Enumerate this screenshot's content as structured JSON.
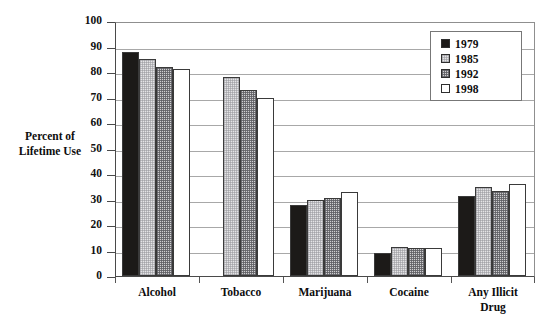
{
  "chart_data": {
    "type": "bar",
    "title": "",
    "xlabel": "",
    "ylabel": "Percent of Lifetime Use",
    "ylim": [
      0,
      100
    ],
    "ytick_step": 10,
    "yticks": [
      0,
      10,
      20,
      30,
      40,
      50,
      60,
      70,
      80,
      90,
      100
    ],
    "grid": true,
    "legend_position": "top-right",
    "categories": [
      "Alcohol",
      "Tobacco",
      "Marijuana",
      "Cocaine",
      "Any Illicit Drug"
    ],
    "series": [
      {
        "name": "1979",
        "color": "#1c1a18",
        "values": [
          88,
          null,
          28,
          9,
          31.5
        ]
      },
      {
        "name": "1985",
        "color": "#e4e4e6",
        "values": [
          85,
          78,
          30,
          11.5,
          35
        ]
      },
      {
        "name": "1992",
        "color": "#cfcfd1",
        "values": [
          82,
          73,
          30.5,
          11,
          33.5
        ]
      },
      {
        "name": "1998",
        "color": "#ffffff",
        "values": [
          81,
          70,
          33,
          11,
          36
        ]
      }
    ]
  },
  "axis": {
    "y_title_line1": "Percent of",
    "y_title_line2": "Lifetime Use"
  },
  "category_labels": [
    {
      "line1": "Alcohol",
      "line2": ""
    },
    {
      "line1": "Tobacco",
      "line2": ""
    },
    {
      "line1": "Marijuana",
      "line2": ""
    },
    {
      "line1": "Cocaine",
      "line2": ""
    },
    {
      "line1": "Any Illicit",
      "line2": "Drug"
    }
  ],
  "legend": {
    "items": [
      {
        "label": "1979",
        "swatch": "swatch-1979"
      },
      {
        "label": "1985",
        "swatch": "swatch-1985"
      },
      {
        "label": "1992",
        "swatch": "swatch-1992"
      },
      {
        "label": "1998",
        "swatch": "swatch-1998"
      }
    ]
  }
}
